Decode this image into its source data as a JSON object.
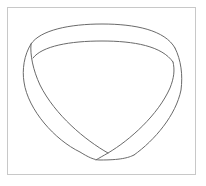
{
  "figure": {
    "frame_color": "#c8c8c8",
    "line_color": "#6a6a6a",
    "background": "#ffffff"
  }
}
